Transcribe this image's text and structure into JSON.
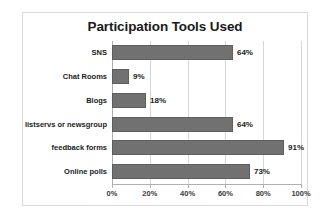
{
  "chart_data": {
    "type": "bar",
    "orientation": "horizontal",
    "title": "Participation Tools Used",
    "xlabel": "",
    "ylabel": "",
    "categories": [
      "SNS",
      "Chat Rooms",
      "Blogs",
      "listservs or newsgroup",
      "feedback forms",
      "Online polls"
    ],
    "values": [
      64,
      9,
      18,
      64,
      91,
      73
    ],
    "data_labels": [
      "64%",
      "9%",
      "18%",
      "64%",
      "91%",
      "73%"
    ],
    "xlim": [
      0,
      100
    ],
    "xticks": [
      0,
      20,
      40,
      60,
      80,
      100
    ],
    "xtick_labels": [
      "0%",
      "20%",
      "40%",
      "60%",
      "80%",
      "100%"
    ],
    "grid": "vertical",
    "legend": "none",
    "bar_color": "#717171",
    "bar_border_color": "#5e5e5e",
    "gridline_color": "#d6d6d6",
    "axis_color": "#b0b0b0",
    "frame_border_color": "#d9d9d9",
    "background": "#ffffff",
    "text_color": "#1a1a1a"
  }
}
